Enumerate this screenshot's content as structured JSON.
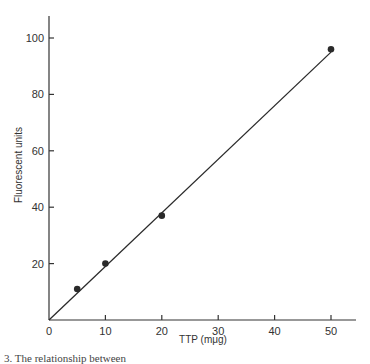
{
  "chart_data": {
    "type": "scatter",
    "title": "",
    "xlabel": "TTP (mμg)",
    "ylabel": "Fluorescent units",
    "xlim": [
      0,
      55
    ],
    "ylim": [
      0,
      107
    ],
    "x_ticks": [
      0,
      10,
      20,
      30,
      40,
      50
    ],
    "y_ticks": [
      20,
      40,
      60,
      80,
      100
    ],
    "x_tick_labels": [
      "0",
      "10",
      "20",
      "30",
      "40",
      "50"
    ],
    "y_tick_labels": [
      "20",
      "40",
      "60",
      "80",
      "100"
    ],
    "grid": false,
    "legend": null,
    "series": [
      {
        "name": "Measured",
        "marker": "filled-circle",
        "x": [
          5,
          10,
          20,
          50
        ],
        "y": [
          11,
          20,
          37,
          96
        ]
      },
      {
        "name": "Fit line",
        "type": "line",
        "x": [
          0,
          50
        ],
        "y": [
          0,
          95
        ]
      }
    ],
    "colors": {
      "ink": "#2a2a2a",
      "background": "#ffffff"
    }
  },
  "caption": "3.  The relationship between"
}
